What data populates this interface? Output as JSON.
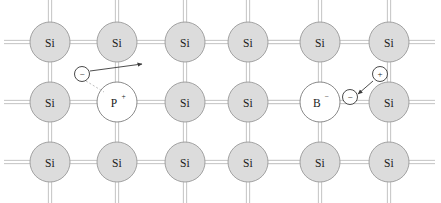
{
  "figure": {
    "background_color": "#ffffff",
    "width": 441,
    "height": 203
  },
  "style": {
    "si_fill": "#dcdcdc",
    "si_stroke": "#9a9a9a",
    "dopant_fill": "#ffffff",
    "dopant_stroke": "#7d7d7d",
    "bond_color": "#c9c9c9",
    "carrier_stroke": "#4a4a4a",
    "arrow_color": "#3a3a3a",
    "text_color": "#1a1a1a",
    "atom_radius": 20,
    "carrier_radius": 7.5,
    "bond_gap": 3.2
  },
  "lattice": {
    "columns_x": [
      50,
      117,
      185,
      248,
      320,
      389
    ],
    "rows_y": [
      42,
      102,
      162
    ],
    "stub_length": 26,
    "atoms": [
      {
        "id": "a-r0-c0",
        "row": 0,
        "col": 0,
        "cx": 50,
        "cy": 42,
        "label": "Si",
        "sup": "",
        "kind": "silicon"
      },
      {
        "id": "a-r0-c1",
        "row": 0,
        "col": 1,
        "cx": 117,
        "cy": 42,
        "label": "Si",
        "sup": "",
        "kind": "silicon"
      },
      {
        "id": "a-r0-c2",
        "row": 0,
        "col": 2,
        "cx": 185,
        "cy": 42,
        "label": "Si",
        "sup": "",
        "kind": "silicon"
      },
      {
        "id": "a-r0-c3",
        "row": 0,
        "col": 3,
        "cx": 248,
        "cy": 42,
        "label": "Si",
        "sup": "",
        "kind": "silicon"
      },
      {
        "id": "a-r0-c4",
        "row": 0,
        "col": 4,
        "cx": 320,
        "cy": 42,
        "label": "Si",
        "sup": "",
        "kind": "silicon"
      },
      {
        "id": "a-r0-c5",
        "row": 0,
        "col": 5,
        "cx": 389,
        "cy": 42,
        "label": "Si",
        "sup": "",
        "kind": "silicon"
      },
      {
        "id": "a-r1-c0",
        "row": 1,
        "col": 0,
        "cx": 50,
        "cy": 102,
        "label": "Si",
        "sup": "",
        "kind": "silicon"
      },
      {
        "id": "a-r1-c1",
        "row": 1,
        "col": 1,
        "cx": 117,
        "cy": 102,
        "label": "P",
        "sup": "+",
        "kind": "donor"
      },
      {
        "id": "a-r1-c2",
        "row": 1,
        "col": 2,
        "cx": 185,
        "cy": 102,
        "label": "Si",
        "sup": "",
        "kind": "silicon"
      },
      {
        "id": "a-r1-c3",
        "row": 1,
        "col": 3,
        "cx": 248,
        "cy": 102,
        "label": "Si",
        "sup": "",
        "kind": "silicon"
      },
      {
        "id": "a-r1-c4",
        "row": 1,
        "col": 4,
        "cx": 320,
        "cy": 102,
        "label": "B",
        "sup": "−",
        "kind": "acceptor"
      },
      {
        "id": "a-r1-c5",
        "row": 1,
        "col": 5,
        "cx": 389,
        "cy": 102,
        "label": "Si",
        "sup": "",
        "kind": "silicon"
      },
      {
        "id": "a-r2-c0",
        "row": 2,
        "col": 0,
        "cx": 50,
        "cy": 162,
        "label": "Si",
        "sup": "",
        "kind": "silicon"
      },
      {
        "id": "a-r2-c1",
        "row": 2,
        "col": 1,
        "cx": 117,
        "cy": 162,
        "label": "Si",
        "sup": "",
        "kind": "silicon"
      },
      {
        "id": "a-r2-c2",
        "row": 2,
        "col": 2,
        "cx": 185,
        "cy": 162,
        "label": "Si",
        "sup": "",
        "kind": "silicon"
      },
      {
        "id": "a-r2-c3",
        "row": 2,
        "col": 3,
        "cx": 248,
        "cy": 162,
        "label": "Si",
        "sup": "",
        "kind": "silicon"
      },
      {
        "id": "a-r2-c4",
        "row": 2,
        "col": 4,
        "cx": 320,
        "cy": 162,
        "label": "Si",
        "sup": "",
        "kind": "silicon"
      },
      {
        "id": "a-r2-c5",
        "row": 2,
        "col": 5,
        "cx": 389,
        "cy": 162,
        "label": "Si",
        "sup": "",
        "kind": "silicon"
      }
    ]
  },
  "carriers": [
    {
      "id": "free-electron-donor",
      "symbol": "−",
      "kind": "electron",
      "cx": 82,
      "cy": 74,
      "r": 7.5
    },
    {
      "id": "bound-electron-acceptor",
      "symbol": "−",
      "kind": "electron",
      "cx": 350,
      "cy": 97,
      "r": 7.5
    },
    {
      "id": "free-hole-acceptor",
      "symbol": "+",
      "kind": "hole",
      "cx": 380,
      "cy": 74,
      "r": 7.5
    }
  ],
  "motion_arrows": [
    {
      "id": "electron-escape-arrow",
      "x1": 90,
      "y1": 71,
      "x2": 142,
      "y2": 64,
      "description": "electron leaving phosphorus donor"
    },
    {
      "id": "electron-capture-arrow",
      "x1": 373,
      "y1": 81,
      "x2": 358,
      "y2": 94,
      "description": "electron moving into hole at boron acceptor"
    }
  ],
  "leader_lines": [
    {
      "id": "donor-leader",
      "x1": 86,
      "y1": 81,
      "x2": 104,
      "y2": 92,
      "description": "dashed leader from electron to phosphorus atom"
    }
  ]
}
